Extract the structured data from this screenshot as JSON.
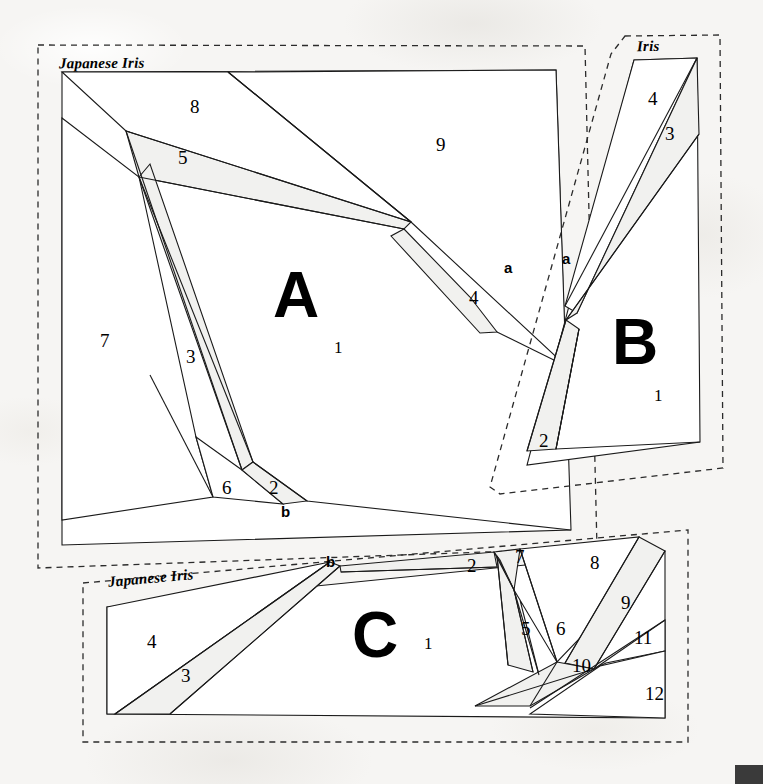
{
  "document": {
    "kind": "quilt-foundation-paper-piecing-pattern",
    "block_name": "Japanese Iris"
  },
  "sections": [
    {
      "id": "A",
      "letter": "A",
      "title": "Japanese Iris",
      "pieces": [
        "1",
        "2",
        "3",
        "4",
        "5",
        "6",
        "7",
        "8",
        "9"
      ]
    },
    {
      "id": "B",
      "letter": "B",
      "title": "Iris",
      "pieces": [
        "1",
        "2",
        "3",
        "4"
      ]
    },
    {
      "id": "C",
      "letter": "C",
      "title": "Japanese Iris",
      "pieces": [
        "1",
        "2",
        "3",
        "4",
        "5",
        "6",
        "7",
        "8",
        "9",
        "10",
        "11",
        "12"
      ]
    }
  ],
  "seam_markers": [
    {
      "label": "a",
      "for": "A-right"
    },
    {
      "label": "a",
      "for": "B-left"
    },
    {
      "label": "b",
      "for": "A-bottom"
    },
    {
      "label": "b",
      "for": "C-top"
    }
  ],
  "titles": {
    "a_title": "Japanese Iris",
    "b_title": "Iris",
    "c_title": "Japanese Iris"
  },
  "letters": {
    "a_letter": "A",
    "b_letter": "B",
    "c_letter": "C"
  },
  "numbers": {
    "a1": "1",
    "a2": "2",
    "a3": "3",
    "a4": "4",
    "a5": "5",
    "a6": "6",
    "a7": "7",
    "a8": "8",
    "a9": "9",
    "b1": "1",
    "b2": "2",
    "b3": "3",
    "b4": "4",
    "c1": "1",
    "c2": "2",
    "c3": "3",
    "c4": "4",
    "c5": "5",
    "c6": "6",
    "c7": "7",
    "c8": "8",
    "c9": "9",
    "c10": "10",
    "c11": "11",
    "c12": "12"
  },
  "marks": {
    "a_right": "a",
    "b_left": "a",
    "a_bottom": "b",
    "c_top": "b"
  },
  "colors": {
    "background": "#f6f5f3",
    "piece_fill_light": "#ffffff",
    "piece_fill_shaded": "#f2f2f0",
    "stroke": "#1a1a1a",
    "dashed_stroke": "#2b2b2b",
    "corner_swatch": "#3a3a3a"
  }
}
